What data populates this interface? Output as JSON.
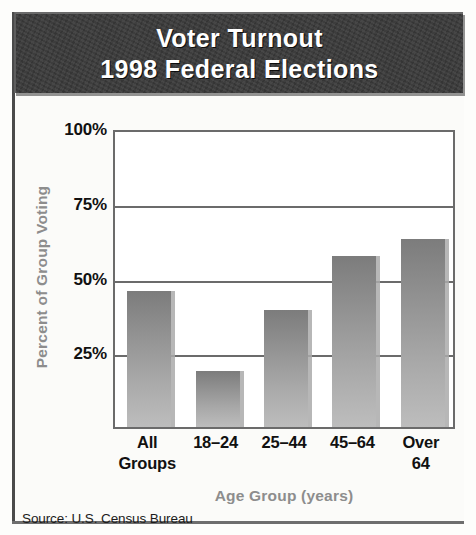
{
  "figure": {
    "title_line_1": "Voter Turnout",
    "title_line_2": "1998 Federal Elections",
    "source": "Source: U.S. Census Bureau",
    "banner_bg": "#3a3a3a",
    "banner_text_color": "#ffffff",
    "axis_title_color": "#8d8d8d",
    "bar_color_top": "#7c7c7c",
    "bar_color_bottom": "#bdbdbd",
    "frame_color": "#6b6b6b"
  },
  "chart_data": {
    "type": "bar",
    "title": "Voter Turnout 1998 Federal Elections",
    "subtitle": "",
    "categories": [
      "All Groups",
      "18–24",
      "25–44",
      "45–64",
      "Over 64"
    ],
    "category_lines": [
      [
        "All",
        "Groups"
      ],
      [
        "18–24"
      ],
      [
        "25–44"
      ],
      [
        "45–64"
      ],
      [
        "Over",
        "64"
      ]
    ],
    "values": [
      45.6,
      18.9,
      39.2,
      57.1,
      63.0
    ],
    "xlabel": "Age Group (years)",
    "ylabel": "Percent of Group Voting",
    "ylim": [
      0,
      100
    ],
    "yticks": [
      100,
      75,
      50,
      25
    ],
    "ytick_labels": [
      "100%",
      "75%",
      "50%",
      "25%"
    ],
    "grid": true,
    "grid_axis": "y",
    "legend": false,
    "legend_position": "none",
    "series": [
      {
        "name": "Percent of Group Voting",
        "values": [
          45.6,
          18.9,
          39.2,
          57.1,
          63.0
        ]
      }
    ]
  }
}
